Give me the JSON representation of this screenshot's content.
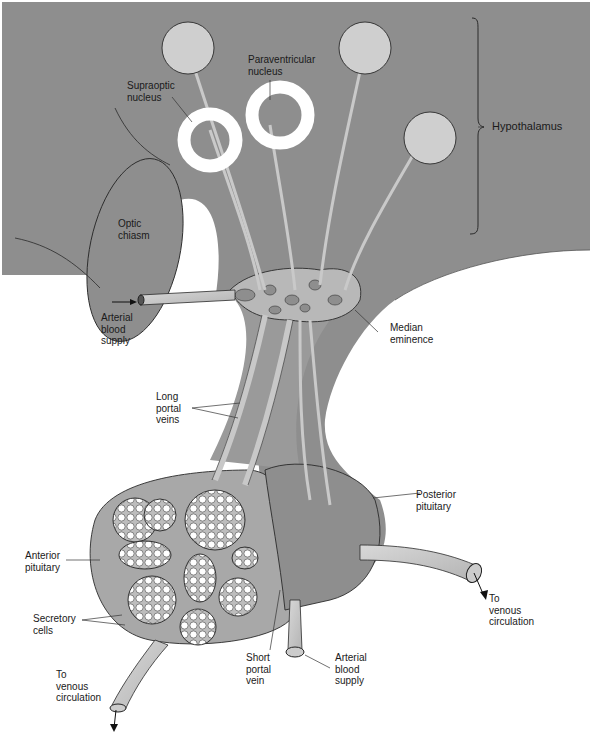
{
  "figure": {
    "colors": {
      "background": "#ffffff",
      "tissue_dark": "#8e8e8e",
      "tissue_mid": "#a3a3a3",
      "vessel": "#c8c8c8",
      "neuron_body": "#cfcfcf",
      "outline": "#2a2a2a",
      "nucleus_ring": "#ffffff"
    }
  },
  "labels": {
    "paraventricular": "Paraventricular\nnucleus",
    "supraoptic": "Supraoptic\nnucleus",
    "hypothalamus": "Hypothalamus",
    "optic_chiasm": "Optic\nchiasm",
    "arterial_top": "Arterial\nblood\nsupply",
    "median_eminence": "Median\neminence",
    "long_portal": "Long\nportal\nveins",
    "posterior_pituitary": "Posterior\npituitary",
    "anterior_pituitary": "Anterior\npituitary",
    "secretory_cells": "Secretory\ncells",
    "venous_right": "To\nvenous\ncirculation",
    "venous_left": "To\nvenous\ncirculation",
    "short_portal": "Short\nportal\nvein",
    "arterial_bottom": "Arterial\nblood\nsupply"
  }
}
